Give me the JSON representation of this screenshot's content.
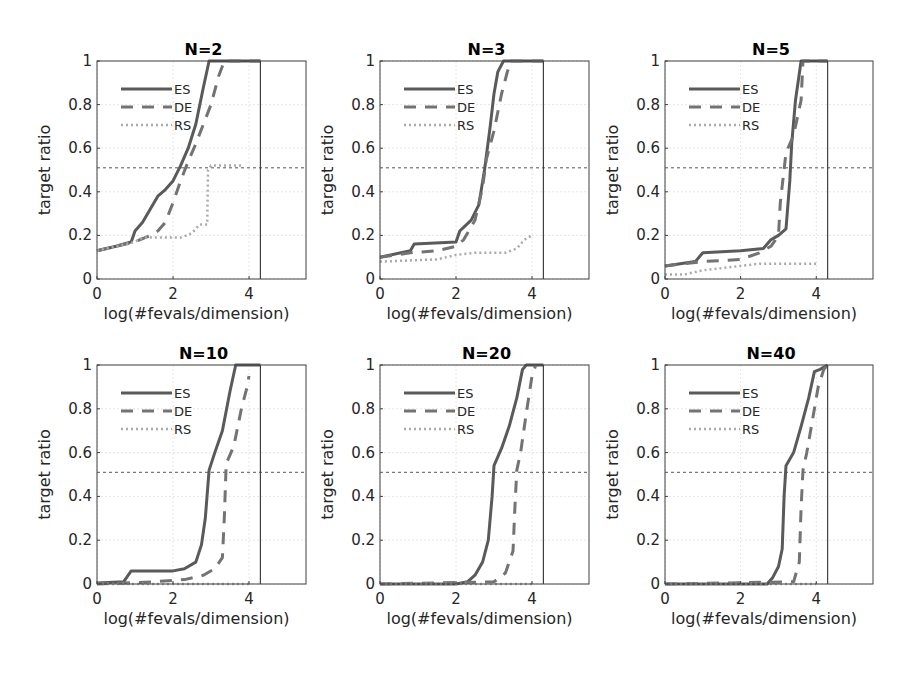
{
  "chart_data": [
    {
      "type": "line",
      "title": "N=2",
      "xlabel": "log(#fevals/dimension)",
      "ylabel": "target ratio",
      "xlim": [
        0,
        5.5
      ],
      "ylim": [
        0,
        1
      ],
      "xticks": [
        "0",
        "2",
        "4"
      ],
      "yticks": [
        "0",
        "0.2",
        "0.4",
        "0.6",
        "0.8",
        "1"
      ],
      "grid": true,
      "legend": "top-left",
      "hline": 0.51,
      "vline": 4.3,
      "series": [
        {
          "name": "ES",
          "x": [
            0,
            0.5,
            0.9,
            1.0,
            1.2,
            1.4,
            1.6,
            1.8,
            2.0,
            2.2,
            2.4,
            2.6,
            2.8,
            2.95,
            3.1,
            4.3
          ],
          "y": [
            0.13,
            0.15,
            0.17,
            0.22,
            0.26,
            0.32,
            0.38,
            0.41,
            0.45,
            0.52,
            0.6,
            0.71,
            0.88,
            1.0,
            1.0,
            1.0
          ]
        },
        {
          "name": "DE",
          "x": [
            0,
            0.5,
            1.0,
            1.4,
            1.6,
            1.8,
            2.0,
            2.2,
            2.4,
            2.6,
            2.8,
            3.0,
            3.2,
            3.35,
            4.3
          ],
          "y": [
            0.13,
            0.15,
            0.17,
            0.2,
            0.22,
            0.26,
            0.35,
            0.45,
            0.54,
            0.62,
            0.71,
            0.8,
            0.93,
            1.0,
            1.0
          ]
        },
        {
          "name": "RS",
          "x": [
            0,
            0.5,
            1.0,
            1.2,
            2.2,
            2.5,
            2.7,
            2.9,
            2.92,
            3.0,
            3.8
          ],
          "y": [
            0.13,
            0.15,
            0.17,
            0.19,
            0.19,
            0.21,
            0.25,
            0.25,
            0.5,
            0.52,
            0.52
          ]
        }
      ]
    },
    {
      "type": "line",
      "title": "N=3",
      "xlabel": "log(#fevals/dimension)",
      "ylabel": "target ratio",
      "xlim": [
        0,
        5.5
      ],
      "ylim": [
        0,
        1
      ],
      "xticks": [
        "0",
        "2",
        "4"
      ],
      "yticks": [
        "0",
        "0.2",
        "0.4",
        "0.6",
        "0.8",
        "1"
      ],
      "grid": true,
      "legend": "top-left",
      "hline": 0.51,
      "vline": 4.3,
      "series": [
        {
          "name": "ES",
          "x": [
            0,
            0.8,
            0.9,
            2.0,
            2.1,
            2.4,
            2.6,
            2.75,
            2.9,
            3.0,
            3.1,
            3.25,
            3.4,
            4.3
          ],
          "y": [
            0.1,
            0.13,
            0.16,
            0.17,
            0.22,
            0.27,
            0.34,
            0.5,
            0.7,
            0.85,
            0.95,
            1.0,
            1.0,
            1.0
          ]
        },
        {
          "name": "DE",
          "x": [
            0,
            0.8,
            1.5,
            2.0,
            2.2,
            2.5,
            2.7,
            2.8,
            3.0,
            3.2,
            3.35,
            3.45,
            4.3
          ],
          "y": [
            0.1,
            0.12,
            0.13,
            0.15,
            0.18,
            0.27,
            0.42,
            0.55,
            0.68,
            0.85,
            0.95,
            1.0,
            1.0
          ]
        },
        {
          "name": "RS",
          "x": [
            0,
            1.5,
            2.0,
            2.5,
            3.3,
            3.6,
            3.8,
            4.0
          ],
          "y": [
            0.08,
            0.09,
            0.11,
            0.12,
            0.12,
            0.14,
            0.18,
            0.2
          ]
        }
      ]
    },
    {
      "type": "line",
      "title": "N=5",
      "xlabel": "log(#fevals/dimension)",
      "ylabel": "target ratio",
      "xlim": [
        0,
        5.5
      ],
      "ylim": [
        0,
        1
      ],
      "xticks": [
        "0",
        "2",
        "4"
      ],
      "yticks": [
        "0",
        "0.2",
        "0.4",
        "0.6",
        "0.8",
        "1"
      ],
      "grid": true,
      "legend": "top-left",
      "hline": 0.51,
      "vline": 4.3,
      "series": [
        {
          "name": "ES",
          "x": [
            0,
            0.8,
            1.0,
            2.0,
            2.6,
            2.8,
            3.0,
            3.2,
            3.3,
            3.35,
            3.45,
            3.6,
            3.8,
            4.3
          ],
          "y": [
            0.06,
            0.08,
            0.12,
            0.13,
            0.14,
            0.18,
            0.2,
            0.23,
            0.45,
            0.62,
            0.82,
            1.0,
            1.0,
            1.0
          ]
        },
        {
          "name": "DE",
          "x": [
            0,
            1.0,
            2.0,
            2.5,
            2.8,
            3.0,
            3.05,
            3.2,
            3.4,
            3.6,
            3.65,
            4.3
          ],
          "y": [
            0.06,
            0.08,
            0.09,
            0.12,
            0.15,
            0.2,
            0.35,
            0.58,
            0.66,
            0.82,
            1.0,
            1.0
          ]
        },
        {
          "name": "RS",
          "x": [
            0,
            0.5,
            1.0,
            1.5,
            2.0,
            2.5,
            4.0
          ],
          "y": [
            0.02,
            0.02,
            0.04,
            0.05,
            0.06,
            0.07,
            0.07
          ]
        }
      ]
    },
    {
      "type": "line",
      "title": "N=10",
      "xlabel": "log(#fevals/dimension)",
      "ylabel": "target ratio",
      "xlim": [
        0,
        5.5
      ],
      "ylim": [
        0,
        1
      ],
      "xticks": [
        "0",
        "2",
        "4"
      ],
      "yticks": [
        "0",
        "0.2",
        "0.4",
        "0.6",
        "0.8",
        "1"
      ],
      "grid": true,
      "legend": "top-left",
      "hline": 0.51,
      "vline": 4.3,
      "series": [
        {
          "name": "ES",
          "x": [
            0,
            0.7,
            0.9,
            2.0,
            2.3,
            2.6,
            2.75,
            2.85,
            2.95,
            3.1,
            3.3,
            3.5,
            3.65,
            4.3
          ],
          "y": [
            0.005,
            0.01,
            0.06,
            0.06,
            0.07,
            0.1,
            0.18,
            0.3,
            0.52,
            0.6,
            0.7,
            0.88,
            1.0,
            1.0
          ]
        },
        {
          "name": "DE",
          "x": [
            0,
            1.5,
            2.3,
            2.8,
            3.1,
            3.3,
            3.35,
            3.4,
            3.6,
            3.8,
            3.95,
            4.0
          ],
          "y": [
            0.0,
            0.01,
            0.02,
            0.04,
            0.07,
            0.12,
            0.3,
            0.55,
            0.63,
            0.8,
            0.9,
            0.95
          ]
        },
        {
          "name": "RS",
          "x": [
            0,
            4.0
          ],
          "y": [
            0.0,
            0.0
          ]
        }
      ]
    },
    {
      "type": "line",
      "title": "N=20",
      "xlabel": "log(#fevals/dimension)",
      "ylabel": "target ratio",
      "xlim": [
        0,
        5.5
      ],
      "ylim": [
        0,
        1
      ],
      "xticks": [
        "0",
        "2",
        "4"
      ],
      "yticks": [
        "0",
        "0.2",
        "0.4",
        "0.6",
        "0.8",
        "1"
      ],
      "grid": true,
      "legend": "top-left",
      "hline": 0.51,
      "vline": 4.3,
      "series": [
        {
          "name": "ES",
          "x": [
            0,
            2.0,
            2.3,
            2.5,
            2.7,
            2.85,
            2.95,
            3.0,
            3.2,
            3.4,
            3.6,
            3.75,
            3.85,
            4.3
          ],
          "y": [
            0.0,
            0.0,
            0.01,
            0.04,
            0.1,
            0.2,
            0.4,
            0.54,
            0.62,
            0.72,
            0.85,
            0.98,
            1.0,
            1.0
          ]
        },
        {
          "name": "DE",
          "x": [
            0,
            3.0,
            3.3,
            3.5,
            3.55,
            3.6,
            3.7,
            3.85,
            4.0,
            4.1
          ],
          "y": [
            0.0,
            0.01,
            0.05,
            0.15,
            0.35,
            0.52,
            0.6,
            0.78,
            0.95,
            1.0
          ]
        },
        {
          "name": "RS",
          "x": [
            0,
            4.0
          ],
          "y": [
            0.0,
            0.0
          ]
        }
      ]
    },
    {
      "type": "line",
      "title": "N=40",
      "xlabel": "log(#fevals/dimension)",
      "ylabel": "target ratio",
      "xlim": [
        0,
        5.5
      ],
      "ylim": [
        0,
        1
      ],
      "xticks": [
        "0",
        "2",
        "4"
      ],
      "yticks": [
        "0",
        "0.2",
        "0.4",
        "0.6",
        "0.8",
        "1"
      ],
      "grid": true,
      "legend": "top-left",
      "hline": 0.51,
      "vline": 4.3,
      "series": [
        {
          "name": "ES",
          "x": [
            0,
            2.7,
            2.85,
            3.0,
            3.1,
            3.15,
            3.2,
            3.4,
            3.6,
            3.8,
            3.95,
            4.1,
            4.3
          ],
          "y": [
            0.0,
            0.0,
            0.03,
            0.08,
            0.16,
            0.4,
            0.54,
            0.6,
            0.72,
            0.85,
            0.97,
            0.98,
            1.0
          ]
        },
        {
          "name": "DE",
          "x": [
            0,
            3.4,
            3.55,
            3.6,
            3.65,
            3.75,
            3.9,
            4.05,
            4.2,
            4.3
          ],
          "y": [
            0.0,
            0.01,
            0.1,
            0.35,
            0.52,
            0.6,
            0.75,
            0.9,
            0.98,
            1.0
          ]
        },
        {
          "name": "RS",
          "x": [
            0,
            4.0
          ],
          "y": [
            0.0,
            0.0
          ]
        }
      ]
    }
  ],
  "legend_labels": [
    "ES",
    "DE",
    "RS"
  ],
  "colors": {
    "ES": "#5a5a5a",
    "DE": "#737373",
    "RS": "#aaaaaa",
    "grid": "#e6e6e6",
    "axis": "#404040"
  }
}
